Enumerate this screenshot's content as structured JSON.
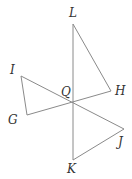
{
  "diagram": {
    "type": "geometry",
    "points": {
      "L": {
        "label": "L",
        "x": 73,
        "y": 24
      },
      "H": {
        "label": "H",
        "x": 111,
        "y": 91
      },
      "I": {
        "label": "I",
        "x": 21,
        "y": 76
      },
      "G": {
        "label": "G",
        "x": 27,
        "y": 115
      },
      "Q": {
        "label": "Q",
        "x": 73,
        "y": 101
      },
      "J": {
        "label": "J",
        "x": 124,
        "y": 129
      },
      "K": {
        "label": "K",
        "x": 73,
        "y": 160
      }
    },
    "segments": [
      [
        "L",
        "K"
      ],
      [
        "L",
        "H"
      ],
      [
        "H",
        "G"
      ],
      [
        "I",
        "G"
      ],
      [
        "I",
        "J"
      ],
      [
        "J",
        "K"
      ]
    ],
    "colors": {
      "line": "#8a8a8a",
      "text": "#333333"
    }
  }
}
